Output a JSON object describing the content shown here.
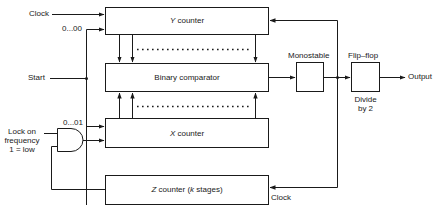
{
  "blocks": {
    "y_counter": {
      "var": "Y",
      "label": " counter"
    },
    "comparator": {
      "label": "Binary comparator"
    },
    "x_counter": {
      "var": "X",
      "label": " counter"
    },
    "z_counter": {
      "var": "Z",
      "label_pre": " counter (",
      "k": "k",
      "label_post": " stages)"
    },
    "monostable": {
      "label": "Monostable"
    },
    "flipflop": {
      "label": "Flip–flop",
      "sub1": "Divide",
      "sub2": "by 2"
    }
  },
  "signals": {
    "clock_top": "Clock",
    "preset_y": "0...00",
    "start": "Start",
    "preset_x": "0...01",
    "lock1": "Lock on",
    "lock2": "frequency",
    "lock3": "1 = low",
    "output": "Output",
    "clock_z": "Clock"
  },
  "colors": {
    "line": "#1a1a1a",
    "background": "#ffffff"
  }
}
